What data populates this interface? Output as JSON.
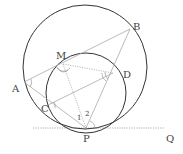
{
  "figure": {
    "colors": {
      "circle": "#333333",
      "line": "#aaaaaa",
      "dotted": "#999999",
      "label": "#444444"
    },
    "points": {
      "A": "A",
      "B": "B",
      "M": "M",
      "D": "D",
      "C": "C",
      "P": "P",
      "Q": "Q"
    },
    "angles": {
      "one": "1",
      "two": "2"
    }
  }
}
